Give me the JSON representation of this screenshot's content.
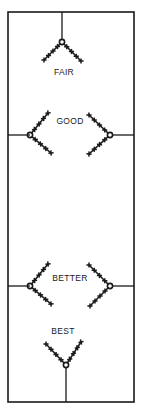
{
  "diagram": {
    "frame": {
      "x": 8,
      "y": 12,
      "width": 126,
      "height": 390
    },
    "stroke_color": "#1a1a1a",
    "labels": {
      "fair": "FAIR",
      "good": "GOOD",
      "better": "BETTER",
      "best": "BEST"
    },
    "label_positions": {
      "fair": {
        "x": 64,
        "y": 68
      },
      "good": {
        "x": 70,
        "y": 117
      },
      "better": {
        "x": 70,
        "y": 274
      },
      "best": {
        "x": 63,
        "y": 327
      }
    },
    "connectors": [
      {
        "x1": 62,
        "y1": 12,
        "x2": 62,
        "y2": 39
      },
      {
        "x1": 8,
        "y1": 135,
        "x2": 30,
        "y2": 135
      },
      {
        "x1": 112,
        "y1": 135,
        "x2": 134,
        "y2": 135
      },
      {
        "x1": 8,
        "y1": 286,
        "x2": 30,
        "y2": 286
      },
      {
        "x1": 112,
        "y1": 286,
        "x2": 134,
        "y2": 286
      },
      {
        "x1": 66,
        "y1": 368,
        "x2": 66,
        "y2": 402
      }
    ],
    "stitch_groups": [
      {
        "name": "fair-stitch",
        "knot": {
          "x": 62,
          "y": 42
        },
        "arms": [
          {
            "dx": -18,
            "dy": 18
          },
          {
            "dx": 19,
            "dy": 19
          }
        ]
      },
      {
        "name": "good-stitch-left",
        "knot": {
          "x": 30,
          "y": 135
        },
        "arms": [
          {
            "dx": 18,
            "dy": -22
          },
          {
            "dx": 21,
            "dy": 18
          }
        ]
      },
      {
        "name": "good-stitch-right",
        "knot": {
          "x": 110,
          "y": 135
        },
        "arms": [
          {
            "dx": -21,
            "dy": -20
          },
          {
            "dx": -21,
            "dy": 19
          }
        ]
      },
      {
        "name": "better-stitch-left",
        "knot": {
          "x": 30,
          "y": 286
        },
        "arms": [
          {
            "dx": 18,
            "dy": -22
          },
          {
            "dx": 21,
            "dy": 18
          }
        ]
      },
      {
        "name": "better-stitch-right",
        "knot": {
          "x": 110,
          "y": 286
        },
        "arms": [
          {
            "dx": -21,
            "dy": -21
          },
          {
            "dx": -20,
            "dy": 20
          }
        ]
      },
      {
        "name": "best-stitch",
        "knot": {
          "x": 66,
          "y": 365
        },
        "arms": [
          {
            "dx": -20,
            "dy": -21
          },
          {
            "dx": 15,
            "dy": -23
          }
        ]
      }
    ],
    "crosses_per_arm": 4
  }
}
